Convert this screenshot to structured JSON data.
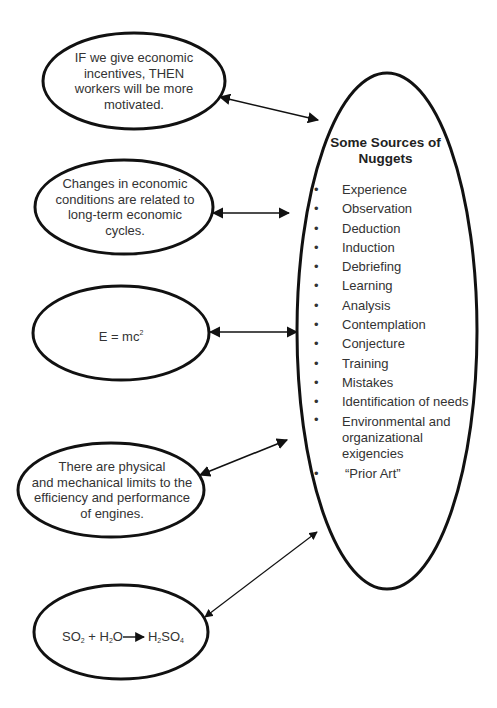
{
  "diagram": {
    "type": "hub-and-spoke",
    "hub": {
      "title": "Some Sources of Nuggets",
      "title_line1": "Some Sources of",
      "title_line2": "Nuggets",
      "sources": [
        "Experience",
        "Observation",
        "Deduction",
        "Induction",
        "Debriefing",
        "Learning",
        "Analysis",
        "Contemplation",
        "Conjecture",
        "Training",
        "Mistakes",
        "Identification of needs",
        "Environmental and organizational exigencies",
        "“Prior Art”"
      ],
      "bullet": "•"
    },
    "nodes": [
      {
        "id": "incentives",
        "lines": [
          "IF we give economic",
          "incentives, THEN",
          "workers will be more",
          "motivated."
        ]
      },
      {
        "id": "economic-cycles",
        "lines": [
          "Changes in economic",
          "conditions are related to",
          "long-term economic",
          "cycles."
        ]
      },
      {
        "id": "mass-energy",
        "text_base": "E = mc",
        "superscript": "2"
      },
      {
        "id": "engine-limits",
        "lines": [
          "There are physical",
          "and mechanical limits to the",
          "efficiency and performance",
          "of engines."
        ]
      },
      {
        "id": "sulfuric-acid",
        "reactant1": "SO",
        "reactant1_sub": "2",
        "plus": " + ",
        "reactant2_a": "H",
        "reactant2_sub": "2",
        "reactant2_b": "O",
        "product_a": "H",
        "product_sub1": "2",
        "product_b": "SO",
        "product_sub2": "4"
      }
    ],
    "connectors": [
      {
        "from": "incentives",
        "to": "hub",
        "style": "double-arrow"
      },
      {
        "from": "economic-cycles",
        "to": "hub",
        "style": "double-arrow"
      },
      {
        "from": "mass-energy",
        "to": "hub",
        "style": "double-arrow"
      },
      {
        "from": "engine-limits",
        "to": "hub",
        "style": "double-arrow"
      },
      {
        "from": "sulfuric-acid",
        "to": "hub",
        "style": "double-arrow"
      }
    ],
    "colors": {
      "stroke": "#111111",
      "text": "#333333",
      "background": "#ffffff"
    }
  }
}
